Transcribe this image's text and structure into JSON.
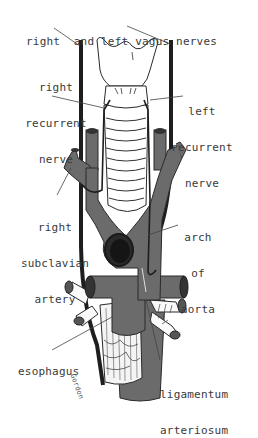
{
  "figure": {
    "colors": {
      "vessel": "#6b6b6b",
      "vessel_dark": "#3c3c3c",
      "outline": "#2a2a2a",
      "cartilage": "#ffffff",
      "label": "#3a3a3a"
    },
    "labels": {
      "vagus": {
        "lines": [
          "right  and left vagus nerves"
        ]
      },
      "right_recurrent": {
        "lines": [
          "right",
          "recurrent",
          "nerve"
        ]
      },
      "left_recurrent": {
        "lines": [
          "left",
          "recurrent",
          "nerve"
        ]
      },
      "right_subclavian": {
        "lines": [
          "right",
          "subclavian",
          "artery"
        ]
      },
      "arch_aorta": {
        "lines": [
          "arch",
          "of",
          "aorta"
        ]
      },
      "esophagus": {
        "lines": [
          "esophagus"
        ]
      },
      "ligamentum": {
        "lines": [
          "ligamentum",
          "arteriosum"
        ]
      }
    },
    "signature": "Gordon"
  }
}
